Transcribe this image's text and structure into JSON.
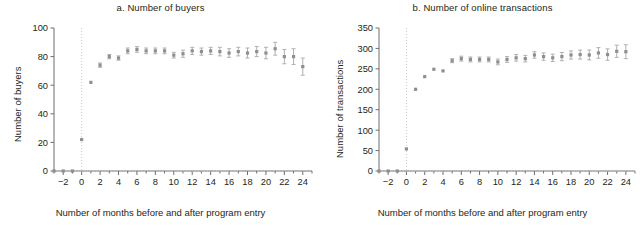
{
  "figure": {
    "background": "#ffffff",
    "marker_color": "#8f8f8f",
    "errorbar_color": "#b0b0b0",
    "axis_color": "#6d6e70",
    "zero_line_color": "#c8c8c8"
  },
  "panels": {
    "a": {
      "title": "a. Number of buyers",
      "ylabel": "Number of buyers",
      "xlabel": "Number of months before and after program entry"
    },
    "b": {
      "title": "b. Number of online transactions",
      "ylabel": "Number of transactions",
      "xlabel": "Number of months before and after program entry"
    }
  },
  "chart_data": [
    {
      "type": "scatter",
      "panel": "a",
      "title": "a. Number of buyers",
      "xlabel": "Number of months before and after program entry",
      "ylabel": "Number of buyers",
      "xlim": [
        -3,
        25
      ],
      "ylim": [
        0,
        100
      ],
      "yticks": [
        0,
        20,
        40,
        60,
        80,
        100
      ],
      "ytick_labels": [
        "0",
        "20",
        "40",
        "60",
        "80",
        "100"
      ],
      "xticks": [
        -2,
        0,
        2,
        4,
        6,
        8,
        10,
        12,
        14,
        16,
        18,
        20,
        22,
        24
      ],
      "xtick_labels": [
        "−2",
        "0",
        "2",
        "4",
        "6",
        "8",
        "10",
        "12",
        "14",
        "16",
        "18",
        "20",
        "22",
        "24"
      ],
      "xminor_ticks": [
        -3,
        -1,
        1,
        3,
        5,
        7,
        9,
        11,
        13,
        15,
        17,
        19,
        21,
        23,
        25
      ],
      "grid": false,
      "reference_lines": [
        {
          "orientation": "vertical",
          "x": 0,
          "style": "dotted"
        },
        {
          "orientation": "horizontal",
          "y": 0,
          "style": "dotted"
        }
      ],
      "x": [
        -3,
        -2,
        -1,
        0,
        1,
        2,
        3,
        4,
        5,
        6,
        7,
        8,
        9,
        10,
        11,
        12,
        13,
        14,
        15,
        16,
        17,
        18,
        19,
        20,
        21,
        22,
        23,
        24
      ],
      "values": [
        0,
        0,
        0,
        22,
        62,
        74,
        80,
        79,
        84,
        85,
        84,
        84,
        84,
        81,
        82,
        84,
        83.5,
        84,
        83.5,
        82.5,
        83.5,
        82.5,
        83.5,
        82.5,
        85.5,
        80,
        80,
        73
      ],
      "err_low": [
        0,
        0,
        0,
        0,
        0,
        1.5,
        1.5,
        1.5,
        2,
        2,
        2,
        2,
        2,
        2,
        2.5,
        2.5,
        2.5,
        2.5,
        3,
        3,
        3,
        3.5,
        3.5,
        4,
        4.5,
        5,
        5.5,
        6
      ],
      "err_high": [
        0,
        0,
        0,
        0,
        0,
        1.5,
        1.5,
        1.5,
        2,
        2,
        2,
        2,
        2,
        2,
        2.5,
        2.5,
        2.5,
        2.5,
        3,
        3,
        3,
        3.5,
        3.5,
        4,
        4.5,
        5,
        5.5,
        6
      ]
    },
    {
      "type": "scatter",
      "panel": "b",
      "title": "b. Number of online transactions",
      "xlabel": "Number of months before and after program entry",
      "ylabel": "Number of transactions",
      "xlim": [
        -3,
        25
      ],
      "ylim": [
        0,
        350
      ],
      "yticks": [
        0,
        50,
        100,
        150,
        200,
        250,
        300,
        350
      ],
      "ytick_labels": [
        "0",
        "50",
        "100",
        "150",
        "200",
        "250",
        "300",
        "350"
      ],
      "xticks": [
        -2,
        0,
        2,
        4,
        6,
        8,
        10,
        12,
        14,
        16,
        18,
        20,
        22,
        24
      ],
      "xtick_labels": [
        "−2",
        "0",
        "2",
        "4",
        "6",
        "8",
        "10",
        "12",
        "14",
        "16",
        "18",
        "20",
        "22",
        "24"
      ],
      "xminor_ticks": [
        -3,
        -1,
        1,
        3,
        5,
        7,
        9,
        11,
        13,
        15,
        17,
        19,
        21,
        23,
        25
      ],
      "grid": false,
      "reference_lines": [
        {
          "orientation": "vertical",
          "x": 0,
          "style": "dotted"
        },
        {
          "orientation": "horizontal",
          "y": 0,
          "style": "dotted"
        }
      ],
      "x": [
        -3,
        -2,
        -1,
        0,
        1,
        2,
        3,
        4,
        5,
        6,
        7,
        8,
        9,
        10,
        11,
        12,
        13,
        14,
        15,
        16,
        17,
        18,
        19,
        20,
        21,
        22,
        23,
        24
      ],
      "values": [
        0,
        0,
        0,
        54,
        200,
        231,
        249,
        245,
        270,
        275,
        273,
        273,
        273,
        267,
        273,
        277,
        275,
        284,
        280,
        277,
        280,
        284,
        285,
        284,
        289,
        285,
        293,
        292
      ],
      "err_low": [
        0,
        0,
        0,
        0,
        0,
        0,
        0,
        0,
        5,
        6,
        6,
        6,
        6,
        7,
        7,
        8,
        8,
        8,
        9,
        9,
        10,
        10,
        11,
        12,
        13,
        14,
        15,
        17
      ],
      "err_high": [
        0,
        0,
        0,
        0,
        0,
        0,
        0,
        0,
        5,
        6,
        6,
        6,
        6,
        7,
        7,
        8,
        8,
        8,
        9,
        9,
        10,
        10,
        11,
        12,
        13,
        14,
        15,
        17
      ]
    }
  ]
}
